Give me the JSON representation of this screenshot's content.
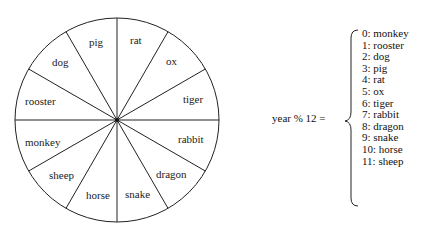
{
  "wheel": {
    "segments": [
      "rat",
      "ox",
      "tiger",
      "rabbit",
      "dragon",
      "snake",
      "horse",
      "sheep",
      "monkey",
      "rooster",
      "dog",
      "pig"
    ]
  },
  "formula": {
    "text": "year % 12 ="
  },
  "mapping": [
    "0: monkey",
    "1: rooster",
    "2: dog",
    "3: pig",
    "4: rat",
    "5: ox",
    "6: tiger",
    "7: rabbit",
    "8: dragon",
    "9: snake",
    "10: horse",
    "11: sheep"
  ]
}
